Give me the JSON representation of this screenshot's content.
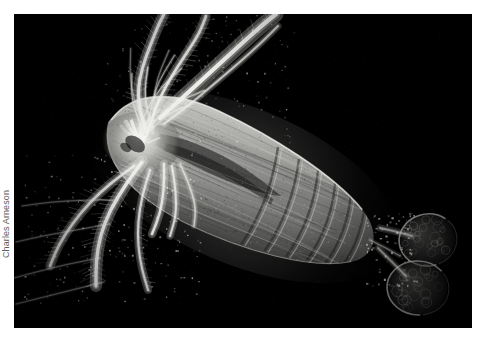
{
  "page": {
    "background_color": "#ffffff",
    "width": 483,
    "height": 343
  },
  "figure": {
    "type": "photograph",
    "technique": "dark-field-microscopy",
    "background_color": "#000000",
    "frame": {
      "x": 14,
      "y": 14,
      "width": 458,
      "height": 314
    }
  },
  "credit": {
    "label": "Charles Arneson",
    "color": "#5d5d5d",
    "orientation": "vertical-left-edge"
  },
  "palette": {
    "background": "#000000",
    "body_highlight": "#d9d9d6",
    "body_midtone": "#9a9a98",
    "body_shadow": "#4a4a4a",
    "appendage_highlight": "#efefec",
    "egg_sac": "#5a5a5a",
    "page": "#ffffff",
    "credit_text": "#5d5d5d"
  }
}
